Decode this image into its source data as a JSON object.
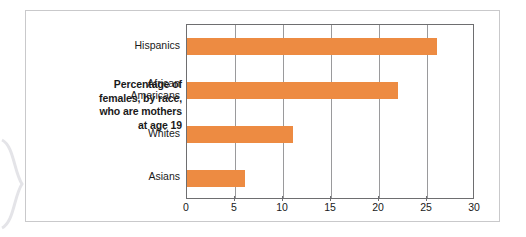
{
  "figure": {
    "caption_lines": [
      "Percentage of",
      "females, by race,",
      "who are mothers",
      "at age 19"
    ]
  },
  "chart_data": {
    "type": "bar",
    "orientation": "horizontal",
    "title": "Percentage of females, by race, who are mothers at age 19",
    "categories": [
      "Hispanics",
      "African Americans",
      "Whites",
      "Asians"
    ],
    "values": [
      26,
      22,
      11,
      6
    ],
    "xlabel": "",
    "ylabel": "",
    "xlim": [
      0,
      30
    ],
    "xticks": [
      0,
      5,
      10,
      15,
      20,
      25,
      30
    ],
    "xtick_labels": [
      "0",
      "5",
      "10",
      "15",
      "20",
      "25",
      "30"
    ],
    "grid": true,
    "grid_axis": "x",
    "legend": false,
    "bar_color": "#ed8b42",
    "gridline_color": "#9a9a9c",
    "axis_color": "#6e6e70",
    "frame_color": "#c9c9cb",
    "background_color": "#ffffff",
    "category_label_lines": [
      [
        "Hispanics"
      ],
      [
        "African",
        "Americans"
      ],
      [
        "Whites"
      ],
      [
        "Asians"
      ]
    ]
  }
}
